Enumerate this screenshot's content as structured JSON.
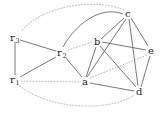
{
  "diagram": {
    "type": "graph",
    "nodes": [
      {
        "id": "r3",
        "base": "r",
        "sub": "3",
        "x": 15,
        "y": 38
      },
      {
        "id": "r2",
        "base": "r",
        "sub": "2",
        "x": 62,
        "y": 53
      },
      {
        "id": "r1",
        "base": "r",
        "sub": "1",
        "x": 15,
        "y": 80
      },
      {
        "id": "a",
        "base": "a",
        "sub": "",
        "x": 85,
        "y": 82
      },
      {
        "id": "b",
        "base": "b",
        "sub": "",
        "x": 97,
        "y": 42
      },
      {
        "id": "c",
        "base": "c",
        "sub": "",
        "x": 128,
        "y": 14
      },
      {
        "id": "e",
        "base": "e",
        "sub": "",
        "x": 151,
        "y": 51
      },
      {
        "id": "d",
        "base": "d",
        "sub": "",
        "x": 139,
        "y": 92
      }
    ],
    "solid_edges": [
      [
        "r1",
        "r3"
      ],
      [
        "r3",
        "r2"
      ],
      [
        "r1",
        "r2"
      ],
      [
        "r2",
        "a"
      ],
      [
        "r2",
        "c"
      ],
      [
        "a",
        "b"
      ],
      [
        "a",
        "c"
      ],
      [
        "a",
        "d"
      ],
      [
        "b",
        "c"
      ],
      [
        "b",
        "e"
      ],
      [
        "b",
        "d"
      ],
      [
        "c",
        "e"
      ],
      [
        "c",
        "d"
      ],
      [
        "e",
        "d"
      ]
    ],
    "dotted_edges": [
      [
        "r3",
        "c"
      ],
      [
        "r2",
        "b"
      ],
      [
        "r1",
        "a"
      ],
      [
        "r1",
        "d"
      ],
      [
        "a",
        "e"
      ]
    ],
    "colors": {
      "solid_edge": "#555555",
      "dotted_edge": "#aaaaaa",
      "label": "#222222",
      "background": "#ffffff"
    }
  }
}
